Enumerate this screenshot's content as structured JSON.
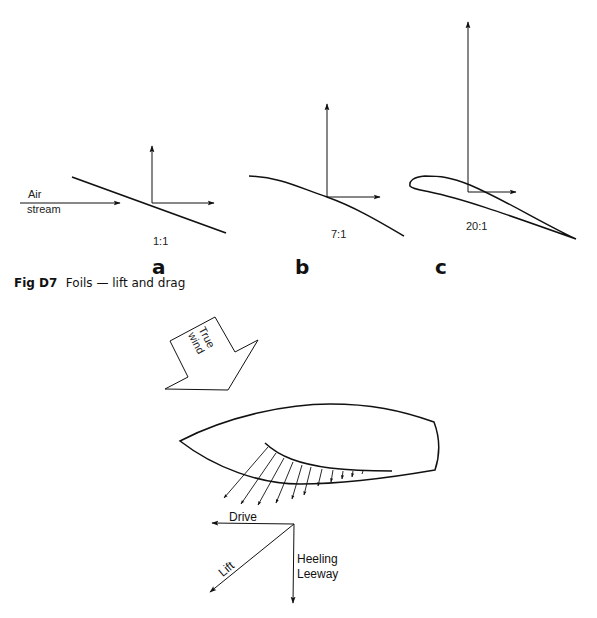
{
  "figure": {
    "caption_number": "Fig D7",
    "caption_text": "Foils — lift and drag"
  },
  "foils": [
    {
      "id": "a",
      "label": "a",
      "ratio": "1:1",
      "description": "flat plate"
    },
    {
      "id": "b",
      "label": "b",
      "ratio": "7:1",
      "description": "curved plate"
    },
    {
      "id": "c",
      "label": "c",
      "ratio": "20:1",
      "description": "aerofoil section"
    }
  ],
  "airstream": {
    "line1": "Air",
    "line2": "stream"
  },
  "wind_arrow": {
    "line1": "True",
    "line2": "wind"
  },
  "forces": {
    "drive": "Drive",
    "lift": "Lift",
    "heeling": "Heeling",
    "leeway": "Leeway"
  }
}
